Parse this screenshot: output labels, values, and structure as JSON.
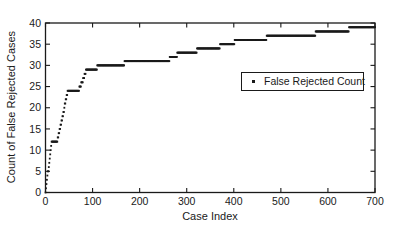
{
  "figure": {
    "background": "#ffffff",
    "ink_color": "#1a1a1a"
  },
  "chart_data": {
    "type": "scatter",
    "subtype": "cumulative-step-dots",
    "title": "",
    "xlabel": "Case Index",
    "ylabel": "Count of False Rejected Cases",
    "xlim": [
      0,
      700
    ],
    "ylim": [
      0,
      40
    ],
    "xticks": [
      0,
      100,
      200,
      300,
      400,
      500,
      600,
      700
    ],
    "yticks": [
      0,
      5,
      10,
      15,
      20,
      25,
      30,
      35,
      40
    ],
    "grid": false,
    "marker_color": "#1a1a1a",
    "marker_size_px": 1.8,
    "legend": {
      "position": "inside-right-middle",
      "entries": [
        {
          "label": "False Rejected Count",
          "marker": "dot",
          "color": "#1a1a1a"
        }
      ]
    },
    "series": [
      {
        "name": "False Rejected Count",
        "marker": "square-dot",
        "color": "#1a1a1a",
        "end_case": 700,
        "final_count": 39,
        "step_points": [
          [
            0,
            0
          ],
          [
            1,
            1
          ],
          [
            2,
            2
          ],
          [
            3,
            3
          ],
          [
            4,
            4
          ],
          [
            5,
            5
          ],
          [
            7,
            6
          ],
          [
            8,
            7
          ],
          [
            9,
            8
          ],
          [
            10,
            9
          ],
          [
            11,
            10
          ],
          [
            12,
            11
          ],
          [
            13,
            12
          ],
          [
            26,
            13
          ],
          [
            28,
            14
          ],
          [
            30,
            15
          ],
          [
            32,
            16
          ],
          [
            34,
            17
          ],
          [
            36,
            18
          ],
          [
            38,
            19
          ],
          [
            40,
            20
          ],
          [
            41,
            21
          ],
          [
            43,
            22
          ],
          [
            45,
            23
          ],
          [
            47,
            24
          ],
          [
            72,
            25
          ],
          [
            76,
            26
          ],
          [
            80,
            27
          ],
          [
            83,
            28
          ],
          [
            86,
            29
          ],
          [
            110,
            30
          ],
          [
            168,
            31
          ],
          [
            264,
            32
          ],
          [
            280,
            33
          ],
          [
            322,
            34
          ],
          [
            371,
            35
          ],
          [
            402,
            36
          ],
          [
            470,
            37
          ],
          [
            574,
            38
          ],
          [
            645,
            39
          ]
        ]
      }
    ],
    "axes_layout": {
      "plot_left_px": 45.5,
      "plot_top_px": 23,
      "plot_right_px": 375,
      "plot_bottom_px": 192.5,
      "tick_direction": "in",
      "box": true
    }
  }
}
